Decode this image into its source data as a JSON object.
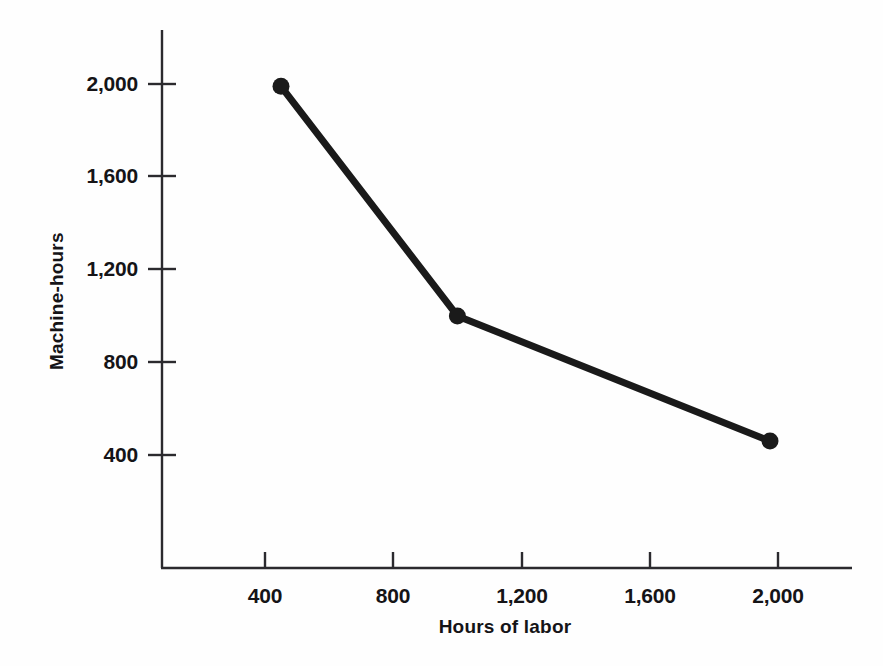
{
  "chart_data": {
    "type": "line",
    "title": "",
    "subtitle": "",
    "xlabel": "Hours of labor",
    "ylabel": "Machine-hours",
    "xlim": [
      0,
      2200
    ],
    "ylim": [
      0,
      2200
    ],
    "xticks": [
      400,
      800,
      1200,
      1600,
      2000
    ],
    "xtick_labels": [
      "400",
      "800",
      "1,200",
      "1,600",
      "2,000"
    ],
    "yticks": [
      400,
      800,
      1200,
      1600,
      2000
    ],
    "ytick_labels": [
      "400",
      "800",
      "1,200",
      "1,600",
      "2,000"
    ],
    "grid": false,
    "legend": false,
    "legend_position": "none",
    "series": [
      {
        "name": "Isoquant",
        "color": "#1a1a1a",
        "line_width": 7,
        "marker": "circle",
        "marker_size": 13,
        "x": [
          450,
          1000,
          1975
        ],
        "y": [
          1990,
          1000,
          460
        ],
        "points": [
          {
            "x": 450,
            "y": 1990
          },
          {
            "x": 1000,
            "y": 1000
          },
          {
            "x": 1975,
            "y": 460
          }
        ]
      }
    ],
    "annotations": []
  },
  "axes": {
    "y_title": "Machine-hours",
    "x_title": "Hours of labor",
    "y_tick_labels": [
      "2,000",
      "1,600",
      "1,200",
      "800",
      "400"
    ],
    "x_tick_labels": [
      "400",
      "800",
      "1,200",
      "1,600",
      "2,000"
    ]
  },
  "colors": {
    "background": "#fefefe",
    "axis": "#2b2a2e",
    "series": "#1a1a1a",
    "text": "#151417"
  },
  "alt_text": "Downward-sloping convex curve of machine-hours against hours of labor with three marked points."
}
